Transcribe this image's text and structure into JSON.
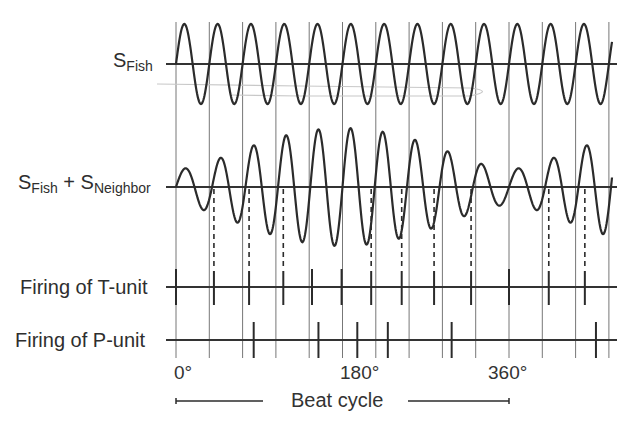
{
  "labels": {
    "s_fish_main": "S",
    "s_fish_sub": "Fish",
    "sum_main_1": "S",
    "sum_sub_1": "Fish",
    "sum_plus": " + ",
    "sum_main_2": "S",
    "sum_sub_2": "Neighbor",
    "t_unit": "Firing of T-unit",
    "p_unit": "Firing of P-unit",
    "deg_0": "0°",
    "deg_180": "180°",
    "deg_360": "360°",
    "beat_cycle": "Beat cycle"
  },
  "colors": {
    "trace": "#2b2b2b",
    "axis": "#333333",
    "gridline": "#777777",
    "artifact": "#c8c8c8"
  },
  "chart_data": {
    "type": "line",
    "title": "",
    "x_axis": {
      "label": "Beat cycle",
      "ticks": [
        "0°",
        "180°",
        "360°"
      ],
      "range_deg": [
        0,
        400
      ]
    },
    "fish_cycles_per_beat": 10,
    "series": [
      {
        "name": "S_Fish",
        "kind": "sine",
        "amplitude": 40,
        "cycles_shown": 13.1
      },
      {
        "name": "S_Fish + S_Neighbor",
        "kind": "beat",
        "fish_amplitude": 38.5,
        "neighbor_amplitude": 20.5,
        "max_envelope_at_deg": 180,
        "min_envelope_at_deg": 0
      }
    ],
    "t_unit_spikes_deg": [
      0,
      41,
      79,
      116,
      147,
      179,
      211,
      244,
      279,
      319,
      360,
      403,
      442
    ],
    "p_unit_spikes_deg": [
      84,
      154,
      196,
      229,
      298,
      454
    ]
  },
  "geom": {
    "x0": 176,
    "beat_px": 333,
    "x_start": 166,
    "x_end": 617,
    "sig_end": 612,
    "fish_y": 64,
    "sum_y": 187,
    "t_y": 287,
    "p_y": 340,
    "grid_top": 22,
    "grid_bottom": 358
  }
}
